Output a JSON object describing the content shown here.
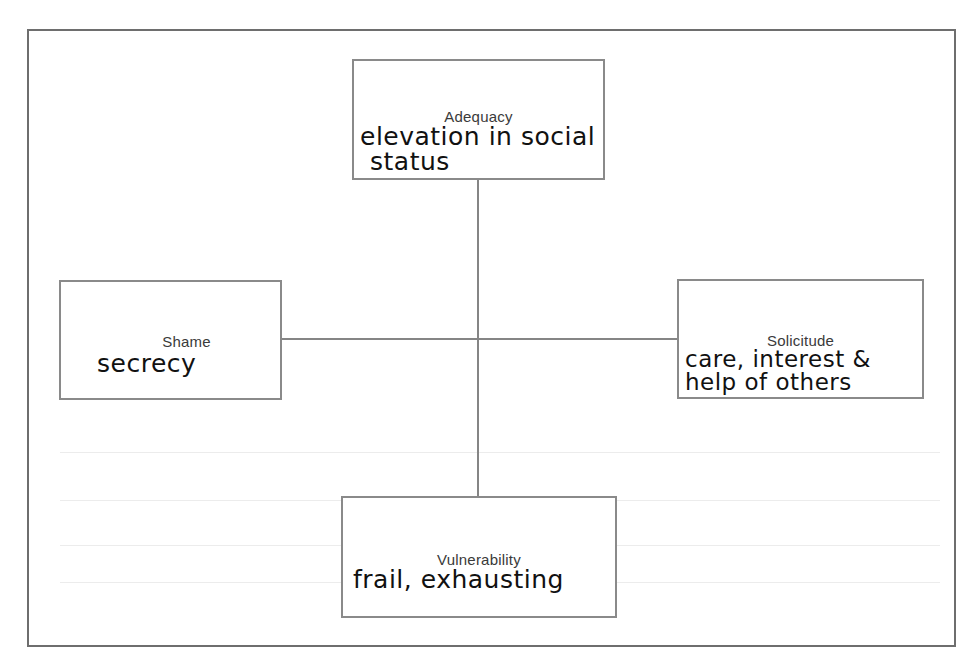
{
  "diagram": {
    "type": "four-quadrant concept map",
    "center_connector": "cross",
    "nodes": {
      "top": {
        "label": "Adequacy",
        "handwritten_lines": [
          "elevation in social",
          "status"
        ]
      },
      "left": {
        "label": "Shame",
        "handwritten_lines": [
          "secrecy"
        ]
      },
      "right": {
        "label": "Solicitude",
        "handwritten_lines": [
          "care, interest &",
          "help of others"
        ]
      },
      "bottom": {
        "label": "Vulnerability",
        "handwritten_lines": [
          "frail, exhausting"
        ]
      }
    },
    "colors": {
      "frame": "#6e6e6e",
      "box_border": "#8a8a8a",
      "connector": "#858585",
      "label_text": "#3a3a3a",
      "handwriting": "#111111"
    }
  }
}
